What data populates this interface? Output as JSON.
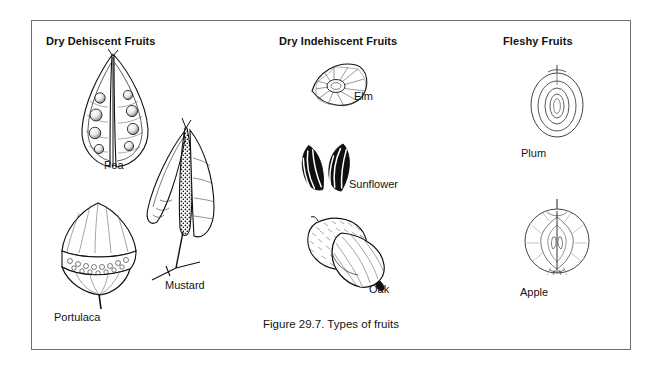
{
  "figure": {
    "caption": "Figure 29.7. Types of fruits",
    "border_color": "#6f6f73",
    "background_color": "#ffffff",
    "ink_color": "#111111"
  },
  "columns": [
    {
      "id": "dry-dehiscent",
      "header": "Dry Dehiscent Fruits",
      "items": [
        {
          "id": "pea",
          "label": "Pea",
          "illustration": "pea-pod-split-with-seeds"
        },
        {
          "id": "mustard",
          "label": "Mustard",
          "illustration": "mustard-silique-open-valves"
        },
        {
          "id": "portulaca",
          "label": "Portulaca",
          "illustration": "portulaca-capsule-with-lid"
        }
      ]
    },
    {
      "id": "dry-indehiscent",
      "header": "Dry Indehiscent Fruits",
      "items": [
        {
          "id": "elm",
          "label": "Elm",
          "illustration": "elm-samara-winged-seed"
        },
        {
          "id": "sunflower",
          "label": "Sunflower",
          "illustration": "sunflower-striped-achenes"
        },
        {
          "id": "oak",
          "label": "Oak",
          "illustration": "oak-acorn-with-cap"
        }
      ]
    },
    {
      "id": "fleshy",
      "header": "Fleshy Fruits",
      "items": [
        {
          "id": "plum",
          "label": "Plum",
          "illustration": "plum-drupe-cross-section"
        },
        {
          "id": "apple",
          "label": "Apple",
          "illustration": "apple-pome-cross-section"
        }
      ]
    }
  ]
}
